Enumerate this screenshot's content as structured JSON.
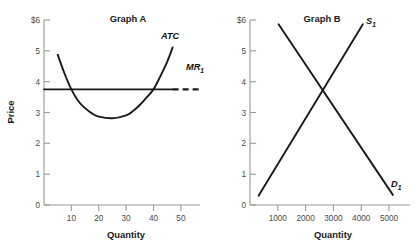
{
  "figure": {
    "background_color": "#ffffff",
    "line_color": "#1a1a1a",
    "axis_color": "#9a9a9a"
  },
  "chart_data": [
    {
      "type": "line",
      "title": "Graph A",
      "xlabel": "Quantity",
      "ylabel": "Price",
      "xlim": [
        0,
        57
      ],
      "ylim": [
        0,
        6.4
      ],
      "grid": false,
      "legend": "inline-annotations",
      "xticks": [
        10,
        20,
        30,
        40,
        50
      ],
      "xtick_labels": [
        "10",
        "20",
        "30",
        "40",
        "50"
      ],
      "yticks": [
        0,
        1,
        2,
        3,
        4,
        5,
        6
      ],
      "ytick_labels": [
        "0",
        "1",
        "2",
        "3",
        "4",
        "5",
        "$6"
      ],
      "series": [
        {
          "name": "ATC",
          "label": "ATC",
          "style": "solid",
          "description": "U-shaped average total cost curve, minimum at (25, 3)",
          "minimum": {
            "x": 25,
            "y": 3
          },
          "points": [
            {
              "x": 5,
              "y": 5.2
            },
            {
              "x": 7.5,
              "y": 4.55
            },
            {
              "x": 10,
              "y": 4.0
            },
            {
              "x": 12.5,
              "y": 3.6
            },
            {
              "x": 15,
              "y": 3.35
            },
            {
              "x": 17.5,
              "y": 3.17
            },
            {
              "x": 20,
              "y": 3.06
            },
            {
              "x": 25,
              "y": 3.0
            },
            {
              "x": 30,
              "y": 3.1
            },
            {
              "x": 32.5,
              "y": 3.25
            },
            {
              "x": 35,
              "y": 3.46
            },
            {
              "x": 37.5,
              "y": 3.72
            },
            {
              "x": 40,
              "y": 4.0
            },
            {
              "x": 42.5,
              "y": 4.45
            },
            {
              "x": 45,
              "y": 4.95
            },
            {
              "x": 47,
              "y": 5.45
            }
          ]
        },
        {
          "name": "MR1",
          "label": "MR",
          "label_sub": "1",
          "style": "solid-then-dashed",
          "description": "Horizontal marginal revenue line at price 4, solid across plot then dashed at right",
          "y_value": 4,
          "solid_x_range": [
            0,
            47
          ],
          "dashed_x_range": [
            47,
            57
          ]
        }
      ],
      "annotations": [
        {
          "text": "ATC",
          "x": 45,
          "y": 5.6
        },
        {
          "text": "MR",
          "sub": "1",
          "x": 49.5,
          "y": 4.45
        }
      ]
    },
    {
      "type": "line",
      "title": "Graph B",
      "xlabel": "Quantity",
      "ylabel": "",
      "xlim": [
        0,
        5600
      ],
      "ylim": [
        0,
        6.4
      ],
      "grid": false,
      "legend": "inline-annotations",
      "xticks": [
        1000,
        2000,
        3000,
        4000,
        5000
      ],
      "xtick_labels": [
        "1000",
        "2000",
        "3000",
        "4000",
        "5000"
      ],
      "yticks": [
        0,
        1,
        2,
        3,
        4,
        5,
        6
      ],
      "ytick_labels": [
        "0",
        "1",
        "2",
        "3",
        "4",
        "5",
        "$6"
      ],
      "equilibrium": {
        "x": 2500,
        "y": 4
      },
      "series": [
        {
          "name": "S1",
          "label": "S",
          "label_sub": "1",
          "style": "solid",
          "description": "Upward sloping supply curve",
          "points": [
            {
              "x": 300,
              "y": 0.32
            },
            {
              "x": 2500,
              "y": 4.0
            },
            {
              "x": 3950,
              "y": 6.25
            }
          ]
        },
        {
          "name": "D1",
          "label": "D",
          "label_sub": "1",
          "style": "solid",
          "description": "Downward sloping demand curve",
          "points": [
            {
              "x": 1000,
              "y": 6.25
            },
            {
              "x": 2500,
              "y": 4.0
            },
            {
              "x": 5000,
              "y": 0.35
            }
          ]
        }
      ],
      "annotations": [
        {
          "text": "S",
          "sub": "1",
          "x": 4200,
          "y": 6.1
        },
        {
          "text": "D",
          "sub": "1",
          "x": 5250,
          "y": 0.75
        }
      ]
    }
  ],
  "graph_a": {
    "title": "Graph A",
    "x_axis_title": "Quantity",
    "y_axis_title": "Price",
    "y_tick_labels": [
      "$6",
      "5",
      "4",
      "3",
      "2",
      "1",
      "0"
    ],
    "x_tick_labels": [
      "10",
      "20",
      "30",
      "40",
      "50"
    ],
    "atc_label": "ATC",
    "mr_label": "MR",
    "mr_sub": "1"
  },
  "graph_b": {
    "title": "Graph B",
    "x_axis_title": "Quantity",
    "y_tick_labels": [
      "$6",
      "5",
      "4",
      "3",
      "2",
      "1",
      "0"
    ],
    "x_tick_labels": [
      "1000",
      "2000",
      "3000",
      "4000",
      "5000"
    ],
    "supply_label": "S",
    "supply_sub": "1",
    "demand_label": "D",
    "demand_sub": "1"
  }
}
